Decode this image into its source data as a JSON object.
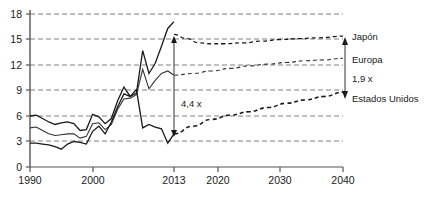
{
  "chart_data": {
    "type": "line",
    "title": "",
    "subtitle": "",
    "xlabel": "",
    "ylabel": "",
    "xlim": [
      1990,
      2040
    ],
    "ylim": [
      0,
      18
    ],
    "grid": true,
    "legend_position": "right-inline",
    "y_ticks": [
      "0",
      "3",
      "6",
      "9",
      "12",
      "15",
      "18"
    ],
    "y_tick_values": [
      0,
      3,
      6,
      9,
      12,
      15,
      18
    ],
    "x_ticks": [
      "1990",
      "2000",
      "2013",
      "2020",
      "2030",
      "2040"
    ],
    "x_tick_values": [
      1990,
      2000,
      2013,
      2020,
      2030,
      2040
    ],
    "history_range": [
      1990,
      2013
    ],
    "forecast_range": [
      2013,
      2040
    ],
    "series": [
      {
        "name": "Japón",
        "label": "Japón",
        "style_history": "solid",
        "style_forecast": "dashed",
        "x": [
          1990,
          1991,
          1992,
          1993,
          1994,
          1995,
          1996,
          1997,
          1998,
          1999,
          2000,
          2001,
          2002,
          2003,
          2004,
          2005,
          2006,
          2007,
          2008,
          2009,
          2010,
          2011,
          2012,
          2013
        ],
        "values": [
          6.0,
          6.1,
          5.7,
          5.3,
          5.0,
          5.2,
          5.3,
          5.1,
          4.3,
          4.4,
          6.2,
          5.9,
          5.1,
          5.7,
          7.8,
          9.4,
          8.3,
          8.7,
          13.7,
          11.0,
          12.2,
          14.2,
          16.3,
          17.1
        ],
        "forecast_x": [
          2013,
          2015,
          2017,
          2019,
          2021,
          2024,
          2027,
          2030,
          2033,
          2036,
          2040
        ],
        "forecast_values": [
          15.6,
          15.1,
          14.6,
          14.5,
          14.5,
          14.6,
          14.8,
          15.0,
          15.1,
          15.2,
          15.4
        ]
      },
      {
        "name": "Europa",
        "label": "Europa",
        "style_history": "solid",
        "style_forecast": "dashed",
        "x": [
          1990,
          1991,
          1992,
          1993,
          1994,
          1995,
          1996,
          1997,
          1998,
          1999,
          2000,
          2001,
          2002,
          2003,
          2004,
          2005,
          2006,
          2007,
          2008,
          2009,
          2010,
          2011,
          2012,
          2013
        ],
        "values": [
          4.6,
          4.7,
          4.3,
          3.9,
          3.7,
          3.8,
          3.9,
          3.9,
          3.4,
          3.6,
          5.1,
          5.2,
          4.4,
          5.0,
          6.8,
          8.0,
          8.1,
          8.5,
          11.5,
          9.2,
          10.2,
          11.0,
          11.3,
          10.8
        ],
        "forecast_x": [
          2013,
          2016,
          2019,
          2022,
          2025,
          2028,
          2031,
          2034,
          2037,
          2040
        ],
        "forecast_values": [
          10.8,
          11.0,
          11.3,
          11.6,
          11.9,
          12.1,
          12.3,
          12.5,
          12.6,
          12.8
        ]
      },
      {
        "name": "Estados Unidos",
        "label": "Estados Unidos",
        "style_history": "solid",
        "style_forecast": "dashed",
        "x": [
          1990,
          1991,
          1992,
          1993,
          1994,
          1995,
          1996,
          1997,
          1998,
          1999,
          2000,
          2001,
          2002,
          2003,
          2004,
          2005,
          2006,
          2007,
          2008,
          2009,
          2010,
          2011,
          2012,
          2013
        ],
        "values": [
          2.8,
          2.8,
          2.7,
          2.6,
          2.4,
          2.1,
          2.7,
          3.0,
          2.9,
          2.7,
          4.2,
          4.8,
          3.9,
          5.3,
          7.1,
          8.6,
          8.3,
          9.1,
          4.6,
          5.0,
          4.7,
          4.5,
          2.8,
          3.9
        ],
        "forecast_x": [
          2013,
          2016,
          2019,
          2022,
          2025,
          2028,
          2031,
          2034,
          2037,
          2040
        ],
        "forecast_values": [
          3.9,
          4.8,
          5.6,
          6.1,
          6.5,
          7.0,
          7.5,
          7.9,
          8.3,
          8.8
        ]
      }
    ],
    "annotations": [
      {
        "id": "ratio-2013",
        "text": "4,4 x",
        "at_x": 2013,
        "from_y": 3.9,
        "to_y": 15.6,
        "arrow": "double-headed"
      },
      {
        "id": "ratio-2040",
        "text": "1,9 x",
        "at_x": 2040,
        "from_y": 8.8,
        "to_y": 15.4,
        "arrow": "double-headed"
      }
    ]
  }
}
